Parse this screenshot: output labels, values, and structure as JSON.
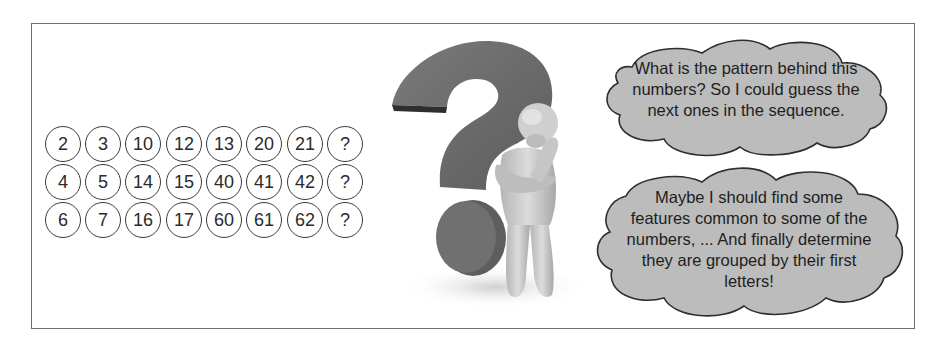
{
  "puzzle": {
    "rows": [
      {
        "cells": [
          "2",
          "3",
          "10",
          "12",
          "13",
          "20",
          "21",
          "?"
        ]
      },
      {
        "cells": [
          "4",
          "5",
          "14",
          "15",
          "40",
          "41",
          "42",
          "?"
        ]
      },
      {
        "cells": [
          "6",
          "7",
          "16",
          "17",
          "60",
          "61",
          "62",
          "?"
        ]
      }
    ]
  },
  "illustration": {
    "description": "3D figure thinking next to a large question mark"
  },
  "thoughts": {
    "top": {
      "lines": [
        "What is the pattern behind this",
        "numbers? So I could guess the",
        "next ones in the sequence."
      ]
    },
    "bottom": {
      "lines": [
        "Maybe I should find some",
        "features common to some of the",
        "numbers, ... And finally determine",
        "they are grouped by their first",
        "letters!"
      ]
    }
  },
  "colors": {
    "frame_border": "#6f6f6f",
    "cloud_fill": "#bcbcbc",
    "cloud_stroke": "#2e2e2e",
    "question_mark": "#6b6b6b",
    "figure": "#c9c9c9"
  }
}
